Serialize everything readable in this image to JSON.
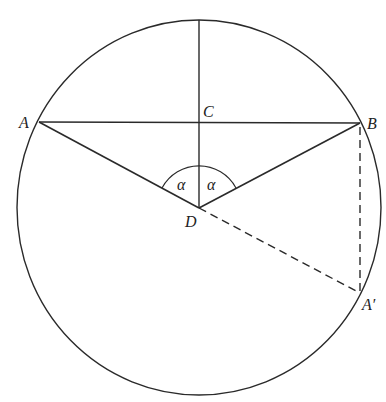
{
  "diagram": {
    "type": "geometry",
    "labels": {
      "A": "A",
      "B": "B",
      "C": "C",
      "D": "D",
      "A_prime": "A′",
      "alpha_left": "α",
      "alpha_right": "α"
    },
    "circle": {
      "cx": 199,
      "cy": 207.5,
      "rx": 182,
      "ry": 187.5
    },
    "points": {
      "A": [
        39,
        122
      ],
      "B": [
        360,
        123
      ],
      "C": [
        199,
        122
      ],
      "D": [
        199,
        208
      ],
      "A_prime": [
        360,
        293
      ],
      "top": [
        199,
        20
      ]
    },
    "segments": [
      {
        "from": "A",
        "to": "B",
        "style": "solid"
      },
      {
        "from": "top",
        "to": "D",
        "style": "solid"
      },
      {
        "from": "A",
        "to": "D",
        "style": "solid"
      },
      {
        "from": "B",
        "to": "D",
        "style": "solid"
      },
      {
        "from": "D",
        "to": "A_prime",
        "style": "dashed"
      },
      {
        "from": "B",
        "to": "A_prime",
        "style": "dashed"
      }
    ],
    "angle_arc": {
      "center": "D",
      "radius": 42,
      "label": "α"
    },
    "colors": {
      "line": "#2a2a2a",
      "background": "#ffffff"
    }
  }
}
